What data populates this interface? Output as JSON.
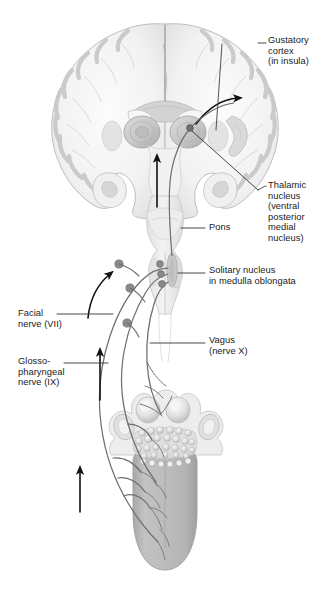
{
  "figure": {
    "background": "#ffffff",
    "width": 330,
    "height": 592
  },
  "labels": [
    {
      "id": "gustatory-cortex",
      "text": "Gustatory\ncortex\n(in insula)",
      "x": 268,
      "y": 40,
      "leader": "elbow-left"
    },
    {
      "id": "thalamic-nucleus",
      "text": "Thalamic\nnucleus\n(ventral\nposterior\nmedial\nnucleus)",
      "x": 268,
      "y": 183,
      "leader": "hook-left"
    },
    {
      "id": "pons",
      "text": "Pons",
      "x": 208,
      "y": 225,
      "leader": "line-left"
    },
    {
      "id": "solitary-nucleus",
      "text": "Solitary nucleus\nin medulla oblongata",
      "x": 208,
      "y": 268,
      "leader": "line-left"
    },
    {
      "id": "vagus",
      "text": "Vagus\n(nerve X)",
      "x": 208,
      "y": 337,
      "leader": "line-left"
    },
    {
      "id": "facial-nerve",
      "text": "Facial\nnerve (VII)",
      "x": 18,
      "y": 310,
      "leader": "line-right"
    },
    {
      "id": "glossopharyngeal-nerve",
      "text": "Glosso-\npharyngeal\nnerve (IX)",
      "x": 18,
      "y": 358,
      "leader": "line-right"
    }
  ],
  "structures": {
    "brain": "coronal-section-cerebrum",
    "brainstem": "pons-and-medulla-oblongata",
    "thalamus": "thalamic-nuclei-pair",
    "solitary_nucleus": "elongated-nucleus-in-medulla",
    "insula": "insular-cortex-fold",
    "tongue": "dorsal-view-with-papillae",
    "papillae": "circumvallate-and-lingual-tonsil",
    "epiglottis": "epiglottic-region"
  },
  "colors": {
    "tissue_light": "#e9e9e9",
    "tissue_mid": "#cfcfcf",
    "tissue_dark": "#b0b0b0",
    "tongue_body": "#b9b9b9",
    "nerve": "#6e6e6e",
    "ganglion": "#808080",
    "arrow": "#111111",
    "leader": "#4a4a4a",
    "text": "#1a1a1a"
  },
  "nerves": [
    {
      "id": "facial-vii",
      "name": "Facial nerve (VII)",
      "roman": "VII",
      "ganglion": true
    },
    {
      "id": "glossopharyngeal-ix",
      "name": "Glossopharyngeal nerve (IX)",
      "roman": "IX",
      "ganglion": true
    },
    {
      "id": "vagus-x",
      "name": "Vagus nerve (X)",
      "roman": "X",
      "ganglion": true
    }
  ],
  "flow_arrows": [
    {
      "id": "arrow-tongue-to-medulla",
      "direction": "up"
    },
    {
      "id": "arrow-medulla-ascending",
      "direction": "up"
    },
    {
      "id": "arrow-brainstem-to-thalamus",
      "direction": "up"
    },
    {
      "id": "arrow-medulla-curved",
      "direction": "up-curved"
    },
    {
      "id": "arrow-thalamus-to-cortex",
      "direction": "curved-right"
    }
  ]
}
